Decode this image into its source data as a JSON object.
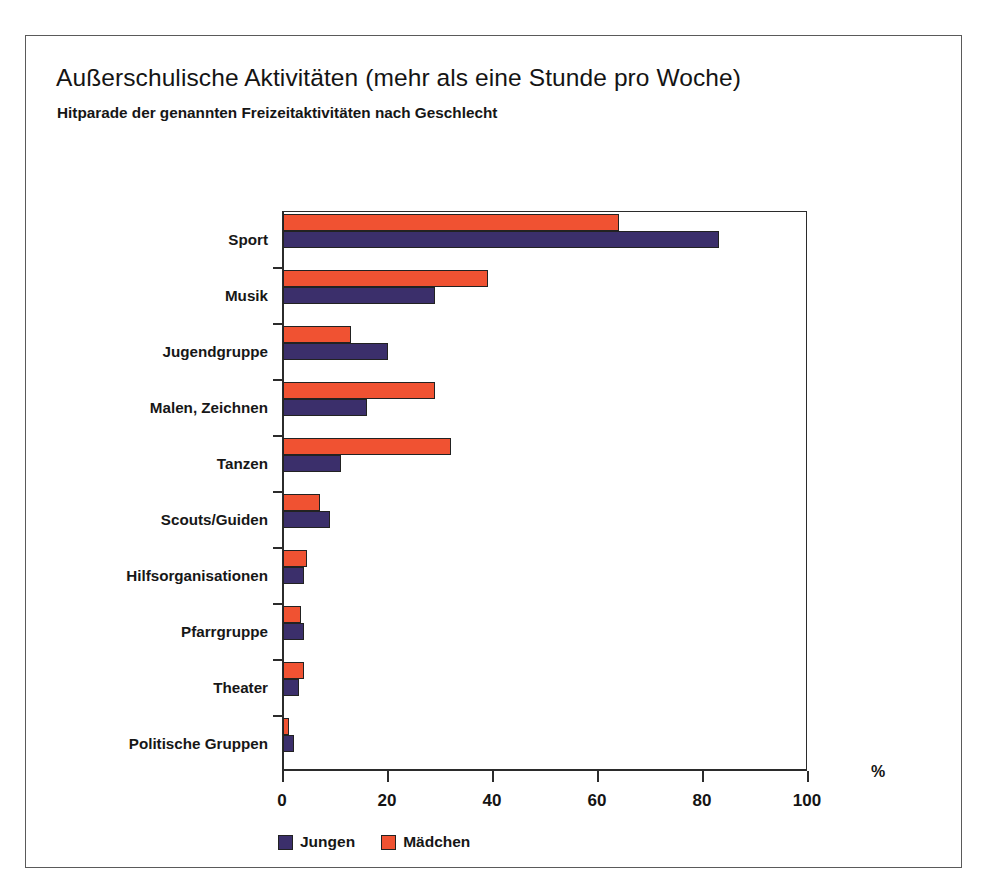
{
  "figure": {
    "title": "Außerschulische Aktivitäten (mehr als eine Stunde pro Woche)",
    "subtitle": "Hitparade der genannten Freizeitaktivitäten nach Geschlecht",
    "unit_label": "%"
  },
  "colors": {
    "boys": "#3B2F6B",
    "girls": "#F05232",
    "axis": "#2b2b2b",
    "frame": "#5a5a5a",
    "background": "#ffffff"
  },
  "chart_data": {
    "type": "bar",
    "orientation": "horizontal",
    "title": "Außerschulische Aktivitäten (mehr als eine Stunde pro Woche)",
    "subtitle": "Hitparade der genannten Freizeitaktivitäten nach Geschlecht",
    "xlabel": "%",
    "ylabel": "",
    "xlim": [
      0,
      100
    ],
    "xticks": [
      0,
      20,
      40,
      60,
      80,
      100
    ],
    "grid": false,
    "legend_position": "bottom-left",
    "categories": [
      "Sport",
      "Musik",
      "Jugendgruppe",
      "Malen, Zeichnen",
      "Tanzen",
      "Scouts/Guiden",
      "Hilfsorganisationen",
      "Pfarrgruppe",
      "Theater",
      "Politische Gruppen"
    ],
    "series": [
      {
        "name": "Jungen",
        "color": "#3B2F6B",
        "values": [
          83,
          29,
          20,
          16,
          11,
          9,
          4,
          4,
          3,
          2
        ]
      },
      {
        "name": "Mädchen",
        "color": "#F05232",
        "values": [
          64,
          39,
          13,
          29,
          32,
          7,
          4.5,
          3.5,
          4,
          1
        ]
      }
    ]
  }
}
